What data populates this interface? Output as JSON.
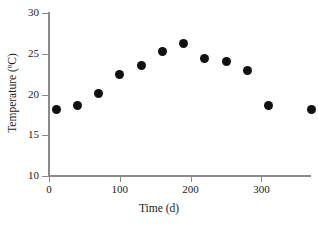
{
  "chart_data": {
    "type": "scatter",
    "title": "",
    "xlabel": "Time (d)",
    "ylabel": "Temperature (ºC)",
    "xlim": [
      0,
      370
    ],
    "ylim": [
      10,
      30
    ],
    "xticks": [
      0,
      100,
      200,
      300
    ],
    "yticks": [
      10,
      15,
      20,
      25,
      30
    ],
    "xtick_labels": [
      "0",
      "100",
      "200",
      "300"
    ],
    "ytick_labels": [
      "10",
      "15",
      "20",
      "25",
      "30"
    ],
    "grid": false,
    "legend": null,
    "marker": {
      "shape": "circle",
      "filled": true,
      "color": "#111111",
      "size_px": 9
    },
    "axis_color": "#8a8a8a",
    "series": [
      {
        "name": "Temperature",
        "points": [
          {
            "x": 10,
            "y": 18.2
          },
          {
            "x": 40,
            "y": 18.6
          },
          {
            "x": 70,
            "y": 20.1
          },
          {
            "x": 100,
            "y": 22.4
          },
          {
            "x": 130,
            "y": 23.5
          },
          {
            "x": 160,
            "y": 25.3
          },
          {
            "x": 190,
            "y": 26.2
          },
          {
            "x": 220,
            "y": 24.4
          },
          {
            "x": 250,
            "y": 24.1
          },
          {
            "x": 280,
            "y": 22.9
          },
          {
            "x": 310,
            "y": 18.6
          },
          {
            "x": 370,
            "y": 18.2
          }
        ]
      }
    ]
  }
}
